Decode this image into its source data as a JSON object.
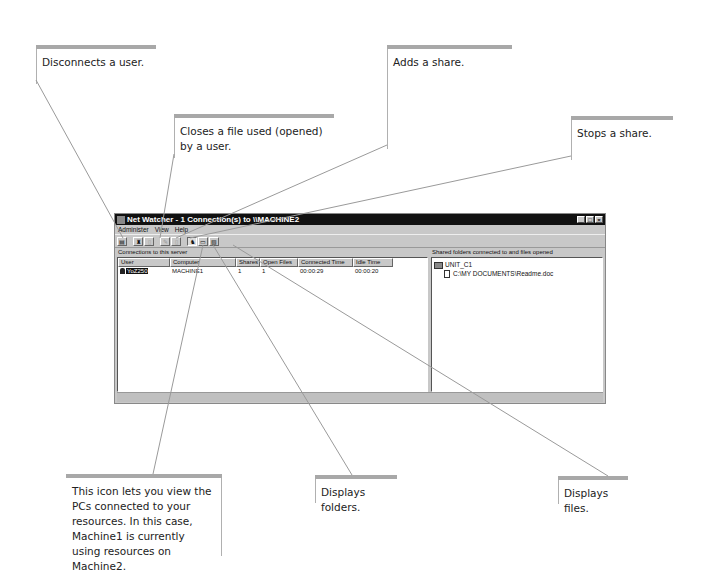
{
  "window": {
    "title": "Net Watcher - 1 Connection(s) to \\\\MACHINE2",
    "controls": {
      "minimize": "_",
      "maximize": "□",
      "close": "×"
    },
    "menu": [
      "Administer",
      "View",
      "Help"
    ],
    "toolbar": [
      {
        "name": "select-server-button",
        "glyph": "▤",
        "state": "normal"
      },
      {
        "name": "disconnect-user-button",
        "glyph": "♜",
        "state": "normal"
      },
      {
        "name": "close-file-button",
        "glyph": "▯",
        "state": "disabled"
      },
      {
        "name": "add-share-button",
        "glyph": "✎",
        "state": "disabled"
      },
      {
        "name": "stop-share-button",
        "glyph": "▯",
        "state": "disabled"
      },
      {
        "name": "show-users-button",
        "glyph": "♞",
        "state": "pressed"
      },
      {
        "name": "show-folders-button",
        "glyph": "▭",
        "state": "normal"
      },
      {
        "name": "show-files-button",
        "glyph": "▧",
        "state": "normal"
      }
    ],
    "left_pane": {
      "label": "Connections to this server",
      "columns": [
        "User",
        "Computer",
        "Shares",
        "Open Files",
        "Connected Time",
        "Idle Time"
      ],
      "rows": [
        {
          "user": "YoZ250",
          "computer": "MACHINE1",
          "shares": "1",
          "open_files": "1",
          "connected_time": "00:00:29",
          "idle_time": "00:00:20"
        }
      ]
    },
    "right_pane": {
      "label": "Shared folders connected to and files opened",
      "tree": [
        {
          "type": "folder",
          "label": "UNIT_C1"
        },
        {
          "type": "file",
          "label": "C:\\MY DOCUMENTS\\Readme.doc"
        }
      ]
    }
  },
  "callouts": {
    "disconnect_user": "Disconnects a user.",
    "close_file": "Closes a file used (opened) by a user.",
    "add_share": "Adds a share.",
    "stop_share": "Stops  a share.",
    "view_pcs": "This icon lets you view the PCs connected to your resources. In this case, Machine1  is currently using resources on Machine2.",
    "display_folders": "Displays folders.",
    "display_files": "Displays files."
  },
  "colors": {
    "callout_bar": "#a8a8a8",
    "titlebar": "#111111",
    "window_bg": "#c8c8c8"
  }
}
